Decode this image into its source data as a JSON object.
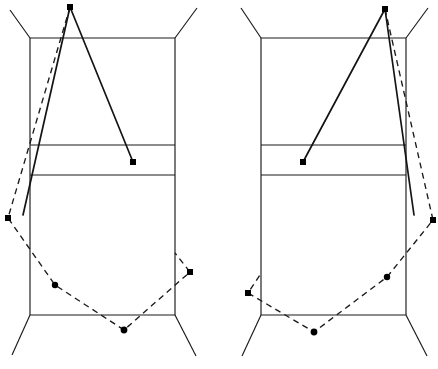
{
  "figure": {
    "background_color": "#ffffff",
    "stroke_color": "#1a1a1a",
    "solid_stroke_color": "#141414",
    "dot_color": "#000000",
    "width": 438,
    "height": 369,
    "panel_count": 2,
    "dash_pattern": "6 4.5"
  },
  "panels": [
    {
      "id": "left-panel",
      "name": "left-diagram",
      "mirror": "original",
      "frame": {
        "box": {
          "left": 30,
          "right": 175,
          "top": 38,
          "bottom": 315
        },
        "horizontal_dividers": [
          145,
          175
        ],
        "legs": [
          {
            "from": [
              30,
              38
            ],
            "to": [
              10,
              10
            ]
          },
          {
            "from": [
              175,
              38
            ],
            "to": [
              197,
              8
            ]
          },
          {
            "from": [
              30,
              315
            ],
            "to": [
              12,
              355
            ]
          },
          {
            "from": [
              175,
              315
            ],
            "to": [
              196,
              356
            ]
          }
        ]
      },
      "solid_polyline": {
        "name": "solid-trace-left",
        "points": [
          [
            23,
            215
          ],
          [
            70,
            7
          ],
          [
            133,
            162
          ]
        ],
        "marked_vertices": [
          [
            70,
            7
          ],
          [
            133,
            162
          ]
        ]
      },
      "dashed_polyline": {
        "name": "dashed-trace-left",
        "points": [
          [
            70,
            7
          ],
          [
            8,
            218
          ],
          [
            55,
            285
          ],
          [
            124,
            330
          ],
          [
            190,
            272
          ],
          [
            175,
            253
          ]
        ],
        "marked_vertices": [
          [
            8,
            218
          ],
          [
            55,
            285
          ],
          [
            124,
            330
          ],
          [
            190,
            272
          ]
        ]
      }
    },
    {
      "id": "right-panel",
      "name": "right-diagram",
      "mirror": "horizontal-mirror-of-left",
      "frame": {
        "box": {
          "left": 261,
          "right": 406,
          "top": 38,
          "bottom": 315
        },
        "horizontal_dividers": [
          145,
          175
        ],
        "legs": [
          {
            "from": [
              261,
              38
            ],
            "to": [
              241,
              8
            ]
          },
          {
            "from": [
              406,
              38
            ],
            "to": [
              428,
              8
            ]
          },
          {
            "from": [
              261,
              315
            ],
            "to": [
              242,
              356
            ]
          },
          {
            "from": [
              406,
              315
            ],
            "to": [
              427,
              356
            ]
          }
        ]
      },
      "solid_polyline": {
        "name": "solid-trace-right",
        "points": [
          [
            303,
            162
          ],
          [
            385,
            9
          ],
          [
            414,
            215
          ]
        ],
        "marked_vertices": [
          [
            385,
            9
          ],
          [
            303,
            162
          ]
        ]
      },
      "dashed_polyline": {
        "name": "dashed-trace-right",
        "points": [
          [
            385,
            9
          ],
          [
            433,
            220
          ],
          [
            387,
            277
          ],
          [
            314,
            332
          ],
          [
            248,
            293
          ],
          [
            262,
            272
          ]
        ],
        "marked_vertices": [
          [
            433,
            220
          ],
          [
            387,
            277
          ],
          [
            314,
            332
          ],
          [
            248,
            293
          ]
        ]
      }
    }
  ],
  "chart_data": {
    "type": "line",
    "xlabel": "",
    "ylabel": "",
    "xlim": [
      0,
      438
    ],
    "ylim": [
      369,
      0
    ],
    "grid": false,
    "legend_position": "none",
    "series": [
      {
        "name": "left-frame-box",
        "style": "solid-thin",
        "x": [
          30,
          175,
          175,
          30,
          30
        ],
        "y": [
          38,
          38,
          315,
          315,
          38
        ]
      },
      {
        "name": "left-divider-upper",
        "style": "solid-thin",
        "x": [
          30,
          175
        ],
        "y": [
          145,
          145
        ]
      },
      {
        "name": "left-divider-lower",
        "style": "solid-thin",
        "x": [
          30,
          175
        ],
        "y": [
          175,
          175
        ]
      },
      {
        "name": "left-leg-top-left",
        "style": "solid-thin",
        "x": [
          30,
          10
        ],
        "y": [
          38,
          10
        ]
      },
      {
        "name": "left-leg-top-right",
        "style": "solid-thin",
        "x": [
          175,
          197
        ],
        "y": [
          38,
          8
        ]
      },
      {
        "name": "left-leg-bottom-left",
        "style": "solid-thin",
        "x": [
          30,
          12
        ],
        "y": [
          315,
          355
        ]
      },
      {
        "name": "left-leg-bottom-right",
        "style": "solid-thin",
        "x": [
          175,
          196
        ],
        "y": [
          315,
          356
        ]
      },
      {
        "name": "left-solid-trace",
        "style": "solid-thick",
        "x": [
          23,
          70,
          133
        ],
        "y": [
          215,
          7,
          162
        ]
      },
      {
        "name": "left-dashed-trace",
        "style": "dashed",
        "x": [
          70,
          8,
          55,
          124,
          190,
          175
        ],
        "y": [
          7,
          218,
          285,
          330,
          272,
          253
        ]
      },
      {
        "name": "right-frame-box",
        "style": "solid-thin",
        "x": [
          261,
          406,
          406,
          261,
          261
        ],
        "y": [
          38,
          38,
          315,
          315,
          38
        ]
      },
      {
        "name": "right-divider-upper",
        "style": "solid-thin",
        "x": [
          261,
          406
        ],
        "y": [
          145,
          145
        ]
      },
      {
        "name": "right-divider-lower",
        "style": "solid-thin",
        "x": [
          261,
          406
        ],
        "y": [
          175,
          175
        ]
      },
      {
        "name": "right-leg-top-left",
        "style": "solid-thin",
        "x": [
          261,
          241
        ],
        "y": [
          38,
          8
        ]
      },
      {
        "name": "right-leg-top-right",
        "style": "solid-thin",
        "x": [
          406,
          428
        ],
        "y": [
          38,
          8
        ]
      },
      {
        "name": "right-leg-bottom-left",
        "style": "solid-thin",
        "x": [
          261,
          242
        ],
        "y": [
          315,
          356
        ]
      },
      {
        "name": "right-leg-bottom-right",
        "style": "solid-thin",
        "x": [
          406,
          427
        ],
        "y": [
          315,
          356
        ]
      },
      {
        "name": "right-solid-trace",
        "style": "solid-thick",
        "x": [
          303,
          385,
          414
        ],
        "y": [
          162,
          9,
          215
        ]
      },
      {
        "name": "right-dashed-trace",
        "style": "dashed",
        "x": [
          385,
          433,
          387,
          314,
          248,
          262
        ],
        "y": [
          9,
          220,
          277,
          332,
          293,
          272
        ]
      }
    ],
    "annotations": [
      {
        "name": "left-apex-dot",
        "x": 70,
        "y": 7,
        "marker": "filled-square"
      },
      {
        "name": "left-solid-end-dot",
        "x": 133,
        "y": 162,
        "marker": "filled-square"
      },
      {
        "name": "left-dash-vertex-1",
        "x": 8,
        "y": 218,
        "marker": "filled-square"
      },
      {
        "name": "left-dash-vertex-2",
        "x": 55,
        "y": 285,
        "marker": "filled-circle"
      },
      {
        "name": "left-dash-vertex-3",
        "x": 124,
        "y": 330,
        "marker": "filled-circle"
      },
      {
        "name": "left-dash-vertex-4",
        "x": 190,
        "y": 272,
        "marker": "filled-square"
      },
      {
        "name": "right-apex-dot",
        "x": 385,
        "y": 9,
        "marker": "filled-square"
      },
      {
        "name": "right-solid-end-dot",
        "x": 303,
        "y": 162,
        "marker": "filled-square"
      },
      {
        "name": "right-dash-vertex-1",
        "x": 433,
        "y": 220,
        "marker": "filled-square"
      },
      {
        "name": "right-dash-vertex-2",
        "x": 387,
        "y": 277,
        "marker": "filled-circle"
      },
      {
        "name": "right-dash-vertex-3",
        "x": 314,
        "y": 332,
        "marker": "filled-circle"
      },
      {
        "name": "right-dash-vertex-4",
        "x": 248,
        "y": 293,
        "marker": "filled-square"
      }
    ]
  }
}
